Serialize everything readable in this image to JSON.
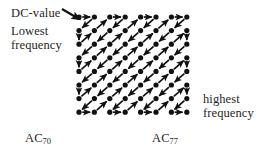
{
  "figure": {
    "title_alt": "JPEG zigzag scan order of an 8x8 DCT coefficient block",
    "background_color": "#ffffff",
    "ink_color": "#111111"
  },
  "labels": {
    "dc_value": "DC-value",
    "lowest_line1": "Lowest",
    "lowest_line2": "frequency",
    "highest_line1": "highest",
    "highest_line2": "frequency",
    "ac_left_base": "AC",
    "ac_left_sub": "70",
    "ac_right_base": "AC",
    "ac_right_sub": "77"
  },
  "grid": {
    "rows": 8,
    "cols": 8,
    "origin_x": 79,
    "origin_y": 17,
    "step_x": 15.4,
    "step_y": 13.6,
    "dot_radius": 2.6,
    "dot_color": "#111111"
  },
  "pointer": {
    "name": "dc-value-pointer-arrow",
    "from_x": 62,
    "from_y": 9,
    "to_x": 79,
    "to_y": 19,
    "color": "#111111"
  },
  "scan_order": [
    [
      0,
      0
    ],
    [
      1,
      0
    ],
    [
      0,
      1
    ],
    [
      0,
      2
    ],
    [
      1,
      1
    ],
    [
      2,
      0
    ],
    [
      3,
      0
    ],
    [
      2,
      1
    ],
    [
      1,
      2
    ],
    [
      0,
      3
    ],
    [
      0,
      4
    ],
    [
      1,
      3
    ],
    [
      2,
      2
    ],
    [
      3,
      1
    ],
    [
      4,
      0
    ],
    [
      5,
      0
    ],
    [
      4,
      1
    ],
    [
      3,
      2
    ],
    [
      2,
      3
    ],
    [
      1,
      4
    ],
    [
      0,
      5
    ],
    [
      0,
      6
    ],
    [
      1,
      5
    ],
    [
      2,
      4
    ],
    [
      3,
      3
    ],
    [
      4,
      2
    ],
    [
      5,
      1
    ],
    [
      6,
      0
    ],
    [
      7,
      0
    ],
    [
      6,
      1
    ],
    [
      5,
      2
    ],
    [
      4,
      3
    ],
    [
      3,
      4
    ],
    [
      2,
      5
    ],
    [
      1,
      6
    ],
    [
      0,
      7
    ],
    [
      1,
      7
    ],
    [
      2,
      6
    ],
    [
      3,
      5
    ],
    [
      4,
      4
    ],
    [
      5,
      3
    ],
    [
      6,
      2
    ],
    [
      7,
      1
    ],
    [
      7,
      2
    ],
    [
      6,
      3
    ],
    [
      5,
      4
    ],
    [
      4,
      5
    ],
    [
      3,
      6
    ],
    [
      2,
      7
    ],
    [
      3,
      7
    ],
    [
      4,
      6
    ],
    [
      5,
      5
    ],
    [
      6,
      4
    ],
    [
      7,
      3
    ],
    [
      7,
      4
    ],
    [
      6,
      5
    ],
    [
      5,
      6
    ],
    [
      4,
      7
    ],
    [
      5,
      7
    ],
    [
      6,
      6
    ],
    [
      7,
      5
    ],
    [
      7,
      6
    ],
    [
      6,
      7
    ],
    [
      7,
      7
    ]
  ]
}
